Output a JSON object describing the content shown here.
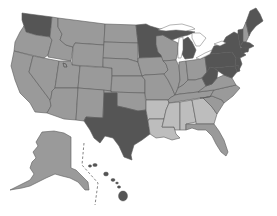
{
  "map": {
    "title": "",
    "type": "choropleth",
    "region": "United States",
    "legend": [],
    "colors": {
      "dark": "#555555",
      "medium": "#9a9a9a",
      "light": "#bdbdbd",
      "background": "#ffffff",
      "border": "#5a5a5a"
    },
    "categories": {
      "dark": [
        "WA",
        "MN",
        "MI",
        "TX",
        "NY",
        "PA",
        "MA",
        "CT",
        "RI",
        "NJ",
        "MD",
        "DE",
        "VT",
        "ME",
        "HI",
        "WV"
      ],
      "light": [
        "AR",
        "LA",
        "MS",
        "AL",
        "GA"
      ],
      "medium": [
        "OR",
        "CA",
        "ID",
        "NV",
        "MT",
        "WY",
        "UT",
        "CO",
        "AZ",
        "NM",
        "ND",
        "SD",
        "NE",
        "KS",
        "OK",
        "IA",
        "MO",
        "WI",
        "IL",
        "IN",
        "OH",
        "KY",
        "TN",
        "NC",
        "SC",
        "VA",
        "FL",
        "NH",
        "AK"
      ]
    }
  }
}
